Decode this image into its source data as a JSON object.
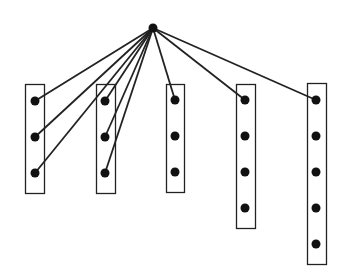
{
  "diagram": {
    "type": "hub-to-groups",
    "colors": {
      "stroke": "#222222",
      "node": "#111111",
      "background": "#ffffff"
    },
    "hub": {
      "id": "hub",
      "x": 153,
      "y": 28,
      "r": 4.5
    },
    "groups": [
      {
        "id": "group-1",
        "box": {
          "x": 25,
          "y": 84,
          "w": 19,
          "h": 109
        },
        "nodes": [
          {
            "x": 35,
            "y": 101
          },
          {
            "x": 35,
            "y": 137
          },
          {
            "x": 35,
            "y": 173
          }
        ]
      },
      {
        "id": "group-2",
        "box": {
          "x": 96,
          "y": 84,
          "w": 19,
          "h": 109
        },
        "nodes": [
          {
            "x": 105,
            "y": 101
          },
          {
            "x": 105,
            "y": 137
          },
          {
            "x": 105,
            "y": 173
          }
        ]
      },
      {
        "id": "group-3",
        "box": {
          "x": 166,
          "y": 84,
          "w": 18,
          "h": 108
        },
        "nodes": [
          {
            "x": 175,
            "y": 100
          },
          {
            "x": 175,
            "y": 136
          },
          {
            "x": 175,
            "y": 172
          }
        ]
      },
      {
        "id": "group-4",
        "box": {
          "x": 236,
          "y": 84,
          "w": 19,
          "h": 144
        },
        "nodes": [
          {
            "x": 245,
            "y": 100
          },
          {
            "x": 245,
            "y": 136
          },
          {
            "x": 245,
            "y": 172
          },
          {
            "x": 245,
            "y": 208
          }
        ]
      },
      {
        "id": "group-5",
        "box": {
          "x": 307,
          "y": 83,
          "w": 19,
          "h": 181
        },
        "nodes": [
          {
            "x": 316,
            "y": 100
          },
          {
            "x": 316,
            "y": 136
          },
          {
            "x": 316,
            "y": 172
          },
          {
            "x": 316,
            "y": 208
          },
          {
            "x": 316,
            "y": 244
          }
        ]
      }
    ],
    "edges": [
      {
        "group": 0,
        "node": 0
      },
      {
        "group": 0,
        "node": 1
      },
      {
        "group": 0,
        "node": 2
      },
      {
        "group": 1,
        "node": 0
      },
      {
        "group": 1,
        "node": 1
      },
      {
        "group": 1,
        "node": 2
      },
      {
        "group": 2,
        "node": 0
      },
      {
        "group": 3,
        "node": 0
      },
      {
        "group": 4,
        "node": 0
      }
    ],
    "node_radius": 4.5
  }
}
